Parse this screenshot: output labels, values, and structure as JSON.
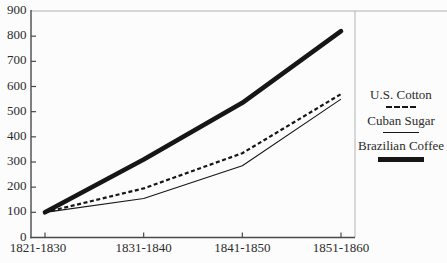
{
  "chart_data": {
    "type": "line",
    "title": "",
    "xlabel": "",
    "ylabel": "",
    "categories": [
      "1821-1830",
      "1831-1840",
      "1841-1850",
      "1851-1860"
    ],
    "series": [
      {
        "name": "U.S. Cotton",
        "style": "dashed",
        "values": [
          100,
          195,
          335,
          570
        ]
      },
      {
        "name": "Cuban Sugar",
        "style": "thin-solid",
        "values": [
          100,
          155,
          285,
          550
        ]
      },
      {
        "name": "Brazilian Coffee",
        "style": "thick-solid",
        "values": [
          100,
          310,
          535,
          820
        ]
      }
    ],
    "ylim": [
      0,
      900
    ],
    "ytick_step": 100,
    "yticks": [
      0,
      100,
      200,
      300,
      400,
      500,
      600,
      700,
      800,
      900
    ],
    "grid": false,
    "legend_position": "right"
  },
  "colors": {
    "line": "#161616",
    "axis": "#4a4a4a",
    "frame": "#b2b2b2",
    "text": "#2b2b2b",
    "background": "#fcfcfc"
  }
}
